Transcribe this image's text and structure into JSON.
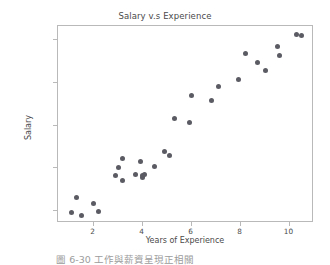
{
  "chart_data": {
    "type": "scatter",
    "title": "Salary v.s Experience",
    "xlabel": "Years of Experience",
    "ylabel": "Salary",
    "xlim": [
      0.55,
      11.0
    ],
    "ylim": [
      34500,
      126500
    ],
    "grid": false,
    "legend": null,
    "marker_color": "#5b5b64",
    "xticks": [
      2,
      4,
      6,
      8,
      10
    ],
    "xtick_labels": [
      "2",
      "4",
      "6",
      "8",
      "10"
    ],
    "yticks": [
      40000,
      60000,
      80000,
      100000,
      120000
    ],
    "ytick_labels": [
      "40000",
      "60000",
      "80000",
      "100000",
      "120000"
    ],
    "series": [
      {
        "name": "Salary",
        "x": [
          1.1,
          1.3,
          1.5,
          2.0,
          2.2,
          2.9,
          3.0,
          3.2,
          3.2,
          3.7,
          3.9,
          4.0,
          4.0,
          4.1,
          4.5,
          4.9,
          5.1,
          5.3,
          5.9,
          6.0,
          6.8,
          7.1,
          7.9,
          8.2,
          8.7,
          9.0,
          9.5,
          9.6,
          10.3,
          10.5
        ],
        "y": [
          39400,
          46500,
          37800,
          43500,
          39900,
          56700,
          60300,
          54500,
          64400,
          57200,
          63200,
          55800,
          56900,
          57100,
          61100,
          67900,
          66000,
          83100,
          81400,
          93900,
          91700,
          98200,
          101300,
          113800,
          109400,
          105600,
          116900,
          112600,
          122400,
          121900
        ]
      }
    ]
  },
  "caption": {
    "text": "圖 6-30  工作與薪資呈現正相關"
  }
}
